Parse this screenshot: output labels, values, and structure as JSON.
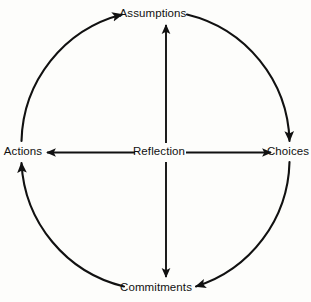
{
  "diagram": {
    "type": "cyclic-flow",
    "background_color": "#fdfdfb",
    "stroke_color": "#111111",
    "center": {
      "id": "reflection",
      "label": "Reflection"
    },
    "nodes": [
      {
        "id": "assumptions",
        "label": "Assumptions",
        "position": "top"
      },
      {
        "id": "choices",
        "label": "Choices",
        "position": "right"
      },
      {
        "id": "commitments",
        "label": "Commitments",
        "position": "bottom"
      },
      {
        "id": "actions",
        "label": "Actions",
        "position": "left"
      }
    ],
    "outer_arcs": [
      {
        "id": "arc-actions-to-assumptions",
        "from": "actions",
        "to": "assumptions",
        "direction": "clockwise",
        "arrowhead_at": "assumptions"
      },
      {
        "id": "arc-assumptions-to-choices",
        "from": "assumptions",
        "to": "choices",
        "direction": "clockwise",
        "arrowhead_at": "choices"
      },
      {
        "id": "arc-choices-to-commitments",
        "from": "choices",
        "to": "commitments",
        "direction": "clockwise",
        "arrowhead_at": "commitments"
      },
      {
        "id": "arc-commitments-to-actions",
        "from": "commitments",
        "to": "actions",
        "direction": "clockwise",
        "arrowhead_at": "actions"
      }
    ],
    "spokes": [
      {
        "id": "spoke-reflection-assumptions",
        "from": "reflection",
        "to": "assumptions",
        "arrowhead_at": "assumptions"
      },
      {
        "id": "spoke-reflection-choices",
        "from": "reflection",
        "to": "choices",
        "arrowhead_at": "choices"
      },
      {
        "id": "spoke-reflection-commitments",
        "from": "reflection",
        "to": "commitments",
        "arrowhead_at": "commitments"
      },
      {
        "id": "spoke-reflection-actions",
        "from": "reflection",
        "to": "actions",
        "arrowhead_at": "actions"
      }
    ]
  }
}
